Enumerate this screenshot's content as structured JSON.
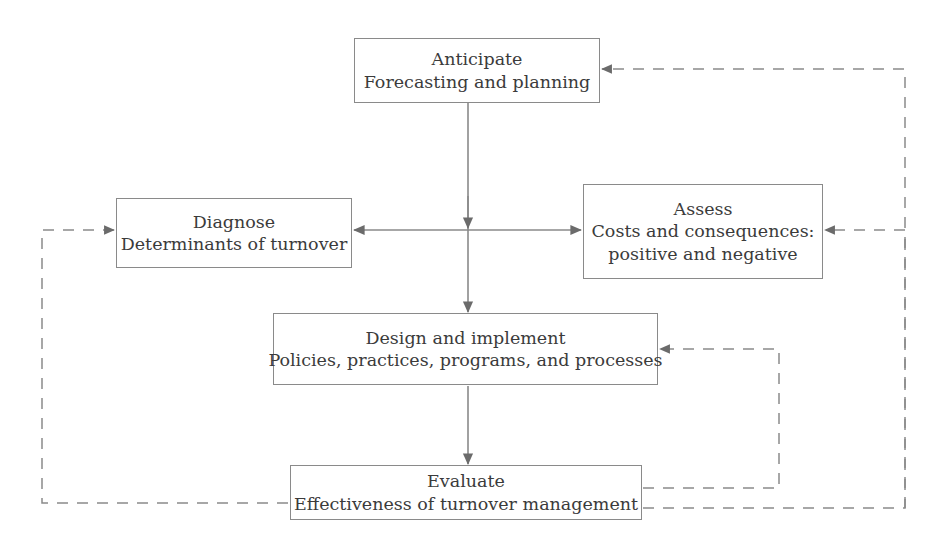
{
  "diagram": {
    "background_color": "#ffffff",
    "line_color": "#8a8a8a",
    "text_color": "#3b3b3b",
    "nodes": [
      {
        "id": "anticipate",
        "title": "Anticipate",
        "subtitle_line1": "Forecasting and planning",
        "subtitle_line2": ""
      },
      {
        "id": "diagnose",
        "title": "Diagnose",
        "subtitle_line1": "Determinants of turnover",
        "subtitle_line2": ""
      },
      {
        "id": "assess",
        "title": "Assess",
        "subtitle_line1": "Costs and consequences:",
        "subtitle_line2": "positive and negative"
      },
      {
        "id": "design",
        "title": "Design and implement",
        "subtitle_line1": "Policies, practices, programs, and processes",
        "subtitle_line2": ""
      },
      {
        "id": "evaluate",
        "title": "Evaluate",
        "subtitle_line1": "Effectiveness of turnover management",
        "subtitle_line2": ""
      }
    ],
    "connectors": [
      {
        "id": "anticipate-to-center",
        "style": "solid",
        "from": "anticipate",
        "to": "center-junction"
      },
      {
        "id": "center-to-diagnose",
        "style": "solid",
        "from": "center-junction",
        "to": "diagnose"
      },
      {
        "id": "center-to-assess",
        "style": "solid",
        "from": "center-junction",
        "to": "assess"
      },
      {
        "id": "center-to-design",
        "style": "solid",
        "from": "center-junction",
        "to": "design"
      },
      {
        "id": "design-to-evaluate",
        "style": "solid",
        "from": "design",
        "to": "evaluate"
      },
      {
        "id": "evaluate-to-design-feedback",
        "style": "dashed",
        "from": "evaluate",
        "to": "design"
      },
      {
        "id": "evaluate-to-assess-feedback",
        "style": "dashed",
        "from": "evaluate",
        "to": "assess"
      },
      {
        "id": "evaluate-to-anticipate-feedback",
        "style": "dashed",
        "from": "evaluate",
        "to": "anticipate"
      },
      {
        "id": "evaluate-to-diagnose-feedback",
        "style": "dashed",
        "from": "evaluate",
        "to": "diagnose"
      }
    ]
  }
}
